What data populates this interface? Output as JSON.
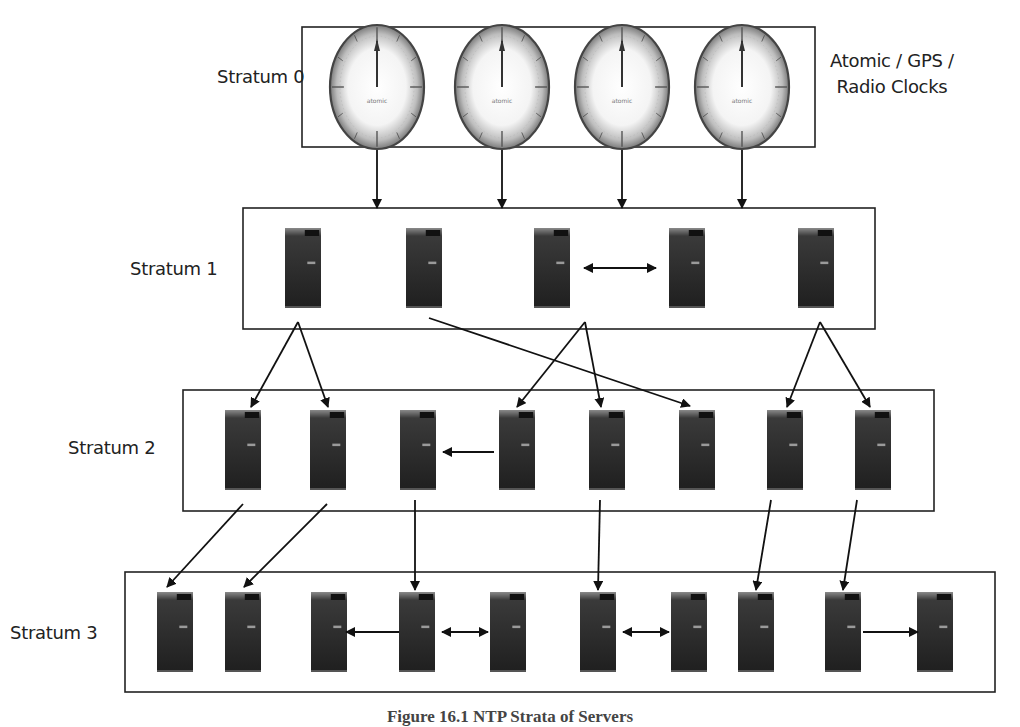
{
  "diagram": {
    "caption": "Figure 16.1 NTP Strata of Servers",
    "colors": {
      "line": "#111111",
      "box_border": "#222222",
      "server": "#2a2a2a",
      "clock_rim": "#555555"
    },
    "strata": [
      {
        "id": "stratum-0",
        "label": "Stratum 0",
        "side_note": [
          "Atomic / GPS /",
          "Radio Clocks"
        ],
        "box": [
          302,
          27,
          513,
          120
        ],
        "node_type": "clock",
        "nodes_x": [
          377,
          502,
          622,
          742
        ],
        "node_cy": 87,
        "clock_face_text": "atomic"
      },
      {
        "id": "stratum-1",
        "label": "Stratum 1",
        "box": [
          243,
          208,
          632,
          121
        ],
        "node_type": "server",
        "nodes_x": [
          303,
          424,
          552,
          687,
          816
        ],
        "node_top": 228,
        "node_h": 80
      },
      {
        "id": "stratum-2",
        "label": "Stratum 2",
        "box": [
          183,
          390,
          751,
          121
        ],
        "node_type": "server",
        "nodes_x": [
          243,
          328,
          418,
          517,
          607,
          697,
          785,
          873
        ],
        "node_top": 410,
        "node_h": 80
      },
      {
        "id": "stratum-3",
        "label": "Stratum 3",
        "box": [
          125,
          572,
          870,
          120
        ],
        "node_type": "server",
        "nodes_x": [
          175,
          243,
          329,
          417,
          508,
          598,
          689,
          756,
          843,
          935
        ],
        "node_top": 592,
        "node_h": 80
      }
    ],
    "labels": [
      {
        "text": "Stratum 0",
        "x": 217,
        "y": 76
      },
      {
        "text": "Stratum 1",
        "x": 130,
        "y": 258
      },
      {
        "text": "Stratum 2",
        "x": 68,
        "y": 440
      },
      {
        "text": "Stratum 3",
        "x": 10,
        "y": 620
      }
    ],
    "arrows": [
      {
        "from": [
          377,
          150
        ],
        "to": [
          377,
          208
        ],
        "kind": "single"
      },
      {
        "from": [
          502,
          150
        ],
        "to": [
          502,
          208
        ],
        "kind": "single"
      },
      {
        "from": [
          622,
          150
        ],
        "to": [
          622,
          208
        ],
        "kind": "single"
      },
      {
        "from": [
          742,
          150
        ],
        "to": [
          742,
          208
        ],
        "kind": "single"
      },
      {
        "from": [
          584,
          268
        ],
        "to": [
          656,
          268
        ],
        "kind": "double"
      },
      {
        "from": [
          298,
          322
        ],
        "to": [
          251,
          407
        ],
        "kind": "single"
      },
      {
        "from": [
          298,
          322
        ],
        "to": [
          328,
          407
        ],
        "kind": "single"
      },
      {
        "from": [
          429,
          318
        ],
        "to": [
          690,
          406
        ],
        "kind": "single"
      },
      {
        "from": [
          585,
          322
        ],
        "to": [
          517,
          407
        ],
        "kind": "single"
      },
      {
        "from": [
          585,
          322
        ],
        "to": [
          601,
          407
        ],
        "kind": "single"
      },
      {
        "from": [
          820,
          322
        ],
        "to": [
          787,
          407
        ],
        "kind": "single"
      },
      {
        "from": [
          820,
          322
        ],
        "to": [
          870,
          407
        ],
        "kind": "single"
      },
      {
        "from": [
          494,
          452
        ],
        "to": [
          443,
          452
        ],
        "kind": "single"
      },
      {
        "from": [
          243,
          504
        ],
        "to": [
          167,
          587
        ],
        "kind": "single"
      },
      {
        "from": [
          327,
          504
        ],
        "to": [
          244,
          587
        ],
        "kind": "single"
      },
      {
        "from": [
          415,
          500
        ],
        "to": [
          415,
          590
        ],
        "kind": "single"
      },
      {
        "from": [
          600,
          500
        ],
        "to": [
          598,
          590
        ],
        "kind": "single"
      },
      {
        "from": [
          771,
          500
        ],
        "to": [
          756,
          590
        ],
        "kind": "single"
      },
      {
        "from": [
          857,
          500
        ],
        "to": [
          843,
          590
        ],
        "kind": "single"
      },
      {
        "from": [
          399,
          632
        ],
        "to": [
          346,
          632
        ],
        "kind": "single"
      },
      {
        "from": [
          442,
          632
        ],
        "to": [
          488,
          632
        ],
        "kind": "double"
      },
      {
        "from": [
          623,
          632
        ],
        "to": [
          669,
          632
        ],
        "kind": "double"
      },
      {
        "from": [
          863,
          632
        ],
        "to": [
          918,
          632
        ],
        "kind": "single"
      }
    ]
  }
}
